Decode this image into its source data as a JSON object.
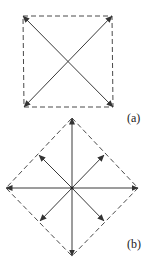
{
  "figure": {
    "panels": [
      {
        "id": "a",
        "label": "(a)",
        "shape": "square",
        "boundary_style": "dashed",
        "corners": {
          "top_left": [
            23,
            16
          ],
          "top_right": [
            112,
            16
          ],
          "bottom_right": [
            113,
            107
          ],
          "bottom_left": [
            24,
            107
          ]
        },
        "center": [
          68,
          61
        ],
        "arrows": [
          {
            "from": "bottom_left",
            "to": "top_right",
            "double_headed": true
          },
          {
            "from": "top_left",
            "to": "bottom_right",
            "double_headed": true
          }
        ]
      },
      {
        "id": "b",
        "label": "(b)",
        "shape": "diamond",
        "boundary_style": "dashed",
        "vertices": {
          "top": [
            72,
            118
          ],
          "right": [
            138,
            188
          ],
          "bottom": [
            72,
            256
          ],
          "left": [
            6,
            188
          ]
        },
        "center": [
          72,
          188
        ],
        "arrows": [
          {
            "direction": "up",
            "to": [
              72,
              118
            ]
          },
          {
            "direction": "down",
            "to": [
              72,
              256
            ]
          },
          {
            "direction": "left",
            "to": [
              6,
              188
            ]
          },
          {
            "direction": "right",
            "to": [
              138,
              188
            ]
          },
          {
            "direction": "up-left",
            "to": [
              39,
              155
            ]
          },
          {
            "direction": "up-right",
            "to": [
              104,
              155
            ]
          },
          {
            "direction": "down-left",
            "to": [
              40,
              221
            ]
          },
          {
            "direction": "down-right",
            "to": [
              104,
              221
            ]
          }
        ]
      }
    ],
    "colors": {
      "line": "#3a3a3a",
      "dashed": "#4a4a4a",
      "background": "#ffffff"
    }
  }
}
